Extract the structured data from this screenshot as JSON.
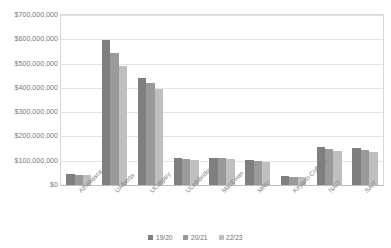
{
  "chart_data": {
    "type": "bar",
    "title": "",
    "subtitle": "",
    "xlabel": "",
    "ylabel": "",
    "ylim": [
      0,
      700000000
    ],
    "grid": true,
    "legend_position": "bottom",
    "y_ticks": [
      "$0",
      "$100,000,000",
      "$200,000,000",
      "$300,000,000",
      "$400,000,000",
      "$500,000,000",
      "$600,000,000",
      "$700,000,000"
    ],
    "y_tick_values": [
      0,
      100000000,
      200000000,
      300000000,
      400000000,
      500000000,
      600000000,
      700000000
    ],
    "categories": [
      "Athabasca",
      "UAlberta",
      "UCalgary",
      "ULethbridge",
      "MacEwan",
      "MRU",
      "Keyano College",
      "NAIT",
      "SAIT"
    ],
    "series": [
      {
        "name": "19/20",
        "color": "#7f7f7f",
        "values": [
          44000000,
          596000000,
          441000000,
          110000000,
          113000000,
          104000000,
          38000000,
          157000000,
          152000000
        ]
      },
      {
        "name": "20/21",
        "color": "#9a9a9a",
        "values": [
          41000000,
          545000000,
          419000000,
          106000000,
          110000000,
          100000000,
          35000000,
          150000000,
          146000000
        ]
      },
      {
        "name": "22/23",
        "color": "#bfbfbf",
        "values": [
          40000000,
          492000000,
          396000000,
          103000000,
          107000000,
          96000000,
          31000000,
          142000000,
          138000000
        ]
      }
    ]
  },
  "colors": {
    "series_19_20": "#7f7f7f",
    "series_20_21": "#9a9a9a",
    "series_22_23": "#bfbfbf",
    "gridline": "#e3e3e3",
    "axis": "#d9d9d9",
    "text": "#7a7a7a",
    "background": "#ffffff"
  }
}
